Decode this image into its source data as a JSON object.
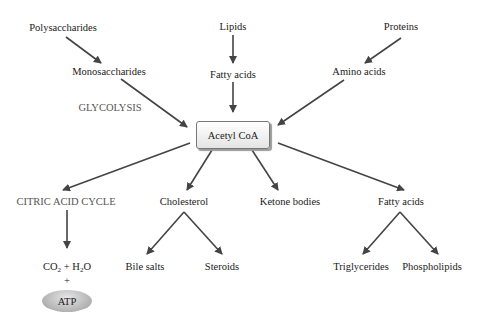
{
  "diagram": {
    "center": "Acetyl CoA",
    "inputs": {
      "polysaccharides": "Polysaccharides",
      "monosaccharides": "Monosaccharides",
      "glycolysis": "GLYCOLYSIS",
      "lipids": "Lipids",
      "fatty_acids_in": "Fatty acids",
      "proteins": "Proteins",
      "amino_acids": "Amino acids"
    },
    "outputs": {
      "citric_acid_cycle": "CITRIC ACID CYCLE",
      "co2": "CO",
      "co2_sub": "2",
      "plus_h": " + H",
      "h2o_sub": "2",
      "o": "O",
      "plus": "+",
      "atp": "ATP",
      "cholesterol": "Cholesterol",
      "bile_salts": "Bile salts",
      "steroids": "Steroids",
      "ketone_bodies": "Ketone bodies",
      "fatty_acids_out": "Fatty acids",
      "triglycerides": "Triglycerides",
      "phospholipids": "Phospholipids"
    },
    "colors": {
      "arrow": "#444444",
      "box_border": "#777777",
      "atp_fill": "#aaaaaa"
    }
  }
}
